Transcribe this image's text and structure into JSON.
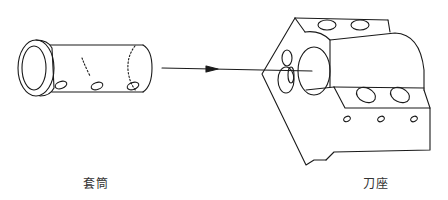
{
  "diagram": {
    "type": "exploded-assembly",
    "parts": [
      {
        "id": "sleeve",
        "label": "套筒",
        "position": "left"
      },
      {
        "id": "tool-holder",
        "label": "刀座",
        "position": "right"
      }
    ],
    "relation": {
      "from": "sleeve",
      "to": "tool-holder",
      "kind": "insert-arrow"
    },
    "colors": {
      "line": "#1a1a1a",
      "background": "#ffffff",
      "text": "#333333"
    }
  }
}
